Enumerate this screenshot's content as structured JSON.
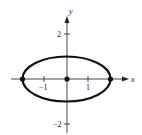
{
  "diagram": {
    "type": "ellipse-graph",
    "equation": "x^2/4 + y^2 = 1",
    "axes": {
      "x_label": "x",
      "y_label": "y",
      "x_ticks": [
        {
          "value": -1,
          "label": "−1"
        },
        {
          "value": 1,
          "label": "1"
        }
      ],
      "y_ticks": [
        {
          "value": 2,
          "label": "2"
        },
        {
          "value": -2,
          "label": "−2"
        }
      ]
    },
    "ellipse": {
      "center": [
        0,
        0
      ],
      "semi_major_x": 2,
      "semi_minor_y": 1
    },
    "points": [
      {
        "name": "center",
        "x": 0,
        "y": 0
      },
      {
        "name": "left-vertex",
        "x": -2,
        "y": 0
      },
      {
        "name": "right-vertex",
        "x": 2,
        "y": 0
      }
    ]
  }
}
